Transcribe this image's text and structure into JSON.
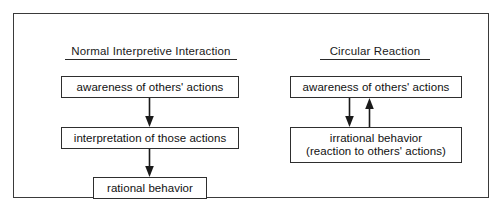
{
  "figure": {
    "panels": [
      {
        "id": "normal-interpretive-interaction",
        "title": "Normal Interpretive Interaction",
        "nodes": [
          {
            "id": "awareness-left",
            "label": "awareness of others' actions"
          },
          {
            "id": "interpretation",
            "label": "interpretation of those actions"
          },
          {
            "id": "rational-behavior",
            "label": "rational behavior"
          }
        ],
        "arrows": [
          {
            "id": "left-arrow-1",
            "direction": "down",
            "from": "awareness-left",
            "to": "interpretation"
          },
          {
            "id": "left-arrow-2",
            "direction": "down",
            "from": "interpretation",
            "to": "rational-behavior"
          }
        ]
      },
      {
        "id": "circular-reaction",
        "title": "Circular Reaction",
        "nodes": [
          {
            "id": "awareness-right",
            "label": "awareness of others' actions"
          },
          {
            "id": "irrational-behavior",
            "label_line1": "irrational behavior",
            "label_line2": "(reaction to others' actions)"
          }
        ],
        "arrows": [
          {
            "id": "right-arrow-down",
            "direction": "down",
            "from": "awareness-right",
            "to": "irrational-behavior"
          },
          {
            "id": "right-arrow-up",
            "direction": "up",
            "from": "irrational-behavior",
            "to": "awareness-right"
          }
        ]
      }
    ],
    "colors": {
      "frame_border": "#3a3a3a",
      "box_border": "#2e2e2e",
      "text": "#111111",
      "arrow": "#1a1a1a",
      "background": "#ffffff"
    }
  }
}
